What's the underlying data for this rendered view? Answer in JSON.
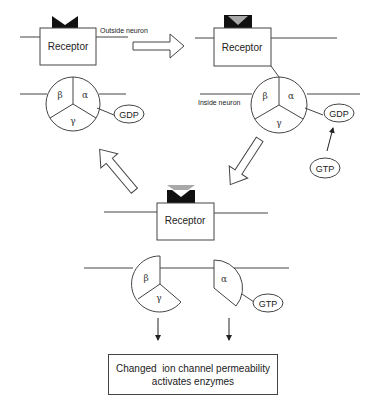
{
  "diagram": {
    "colors": {
      "stroke": "#444444",
      "ligand_black": "#111111",
      "ligand_gray": "#a8a8a8",
      "background": "#ffffff"
    },
    "labels": {
      "outside": "Outside neuron",
      "inside": "Inside neuron"
    },
    "stage1": {
      "receptor": "Receptor",
      "subunits": {
        "beta": "β",
        "alpha": "α",
        "gamma": "γ"
      },
      "nucleotide": "GDP"
    },
    "stage2": {
      "receptor": "Receptor",
      "subunits": {
        "beta": "β",
        "alpha": "α",
        "gamma": "γ"
      },
      "nucleotide": "GDP",
      "incoming": "GTP"
    },
    "stage3": {
      "receptor": "Receptor",
      "subunits": {
        "beta": "β",
        "gamma": "γ",
        "alpha": "α"
      },
      "nucleotide": "GTP"
    },
    "effect": {
      "line1": "Changed  ion channel permeability",
      "line2": "activates enzymes"
    }
  }
}
